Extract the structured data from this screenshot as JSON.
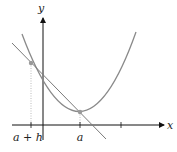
{
  "figure": {
    "labels": {
      "y_axis": "y",
      "x_axis": "x",
      "tick_a_plus_h": "a + h",
      "tick_a": "a"
    },
    "colors": {
      "curve": "#8a8a8a",
      "secant": "#7a7a7a",
      "axes": "#111111",
      "points": "#9a9a9a",
      "dotted_guides": "#aaaaaa"
    }
  }
}
